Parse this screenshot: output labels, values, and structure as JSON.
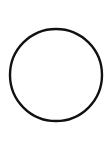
{
  "canvas": {
    "width": 112,
    "height": 143,
    "background": "#ffffff"
  },
  "shape": {
    "type": "circle",
    "cx": 56,
    "cy": 75,
    "r": 46,
    "stroke": "#111111",
    "stroke_width": 2.4,
    "fill": "none"
  }
}
